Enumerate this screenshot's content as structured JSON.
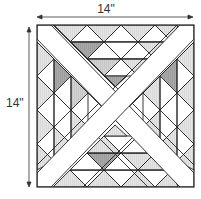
{
  "dimensions": {
    "width_label": "14\"",
    "height_label": "14\""
  },
  "block": {
    "description": "Quilt block: square with white X sashing and four triangular fields of half-square triangles",
    "colors": {
      "outline": "#222222",
      "sashing": "#ffffff",
      "light": "#e6e6e6",
      "medium": "#cfcfcf",
      "dark": "#9a9a9a",
      "white": "#ffffff"
    }
  }
}
